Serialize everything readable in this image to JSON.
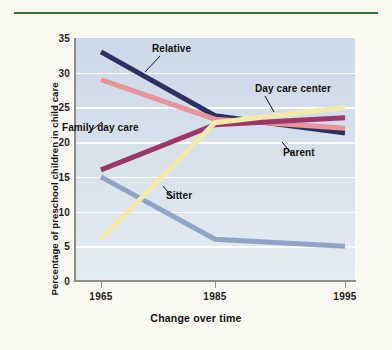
{
  "figure": {
    "background_color": "#fbfaf2",
    "rule_color": "#3b6b3b",
    "plot_background_color": "#d3dfeb"
  },
  "chart_data": {
    "type": "line",
    "title": "",
    "xlabel": "Change over time",
    "ylabel": "Percentage of preschool children in child care",
    "x": [
      1965,
      1985,
      1995
    ],
    "xtick_labels": [
      "1965",
      "1985",
      "1995"
    ],
    "ytick_labels": [
      "0",
      "5",
      "10",
      "15",
      "20",
      "25",
      "30",
      "35"
    ],
    "yticks": [
      0,
      5,
      10,
      15,
      20,
      25,
      30,
      35
    ],
    "ylim": [
      0,
      35
    ],
    "xlim": [
      1960,
      1999
    ],
    "grid": true,
    "grid_axis": "y",
    "legend": "inline-labels",
    "series": [
      {
        "name": "Relative",
        "color": "#2c3163",
        "values": [
          33.0,
          23.8,
          21.3
        ],
        "label_x": 1974.5,
        "label_y": 31.0
      },
      {
        "name": "Parent",
        "color": "#e8949a",
        "values": [
          29.0,
          23.3,
          22.0
        ],
        "label_x": 1992.0,
        "label_y": 18.6
      },
      {
        "name": "Family day care",
        "color": "#9c3668",
        "values": [
          16.0,
          22.5,
          23.5
        ],
        "label_x": 1967.0,
        "label_y": 21.6
      },
      {
        "name": "Sitter",
        "color": "#8fa4c6",
        "values": [
          15.0,
          6.0,
          5.0
        ],
        "label_x": 1977.0,
        "label_y": 12.2
      },
      {
        "name": "Day care center",
        "color": "#f5e9a8",
        "values": [
          6.0,
          22.8,
          25.0
        ],
        "label_x": 1987.0,
        "label_y": 28.0
      }
    ]
  }
}
